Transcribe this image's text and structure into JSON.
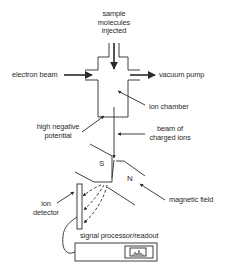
{
  "diagram": {
    "labels": {
      "sample_line1": "sample",
      "sample_line2": "molecules",
      "sample_line3": "injected",
      "electron_beam": "electron beam",
      "vacuum_pump": "vacuum pump",
      "ion_chamber": "ion chamber",
      "high_neg_line1": "high negative",
      "high_neg_line2": "potential",
      "beam_line1": "beam of",
      "beam_line2": "charged ions",
      "magnet_s": "S",
      "magnet_n": "N",
      "magnetic_field": "magnetic field",
      "ion_line1": "ion",
      "ion_line2": "detector",
      "signal_processor": "signal processor/readout"
    },
    "colors": {
      "stroke": "#2a2a2a",
      "background": "#ffffff"
    }
  }
}
